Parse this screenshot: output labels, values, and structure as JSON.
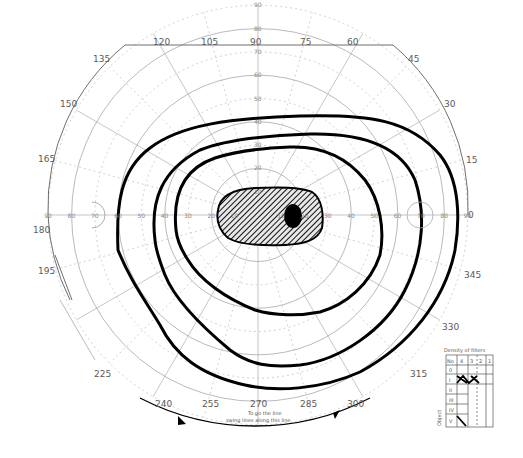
{
  "chart_title": "Goldmann visual field chart",
  "center": {
    "x": 258,
    "y": 215
  },
  "px_per_10deg": 23.3,
  "meridian_labels": [
    {
      "angle": 0,
      "text": "0"
    },
    {
      "angle": 15,
      "text": "15"
    },
    {
      "angle": 30,
      "text": "30"
    },
    {
      "angle": 45,
      "text": "45"
    },
    {
      "angle": 60,
      "text": "60"
    },
    {
      "angle": 75,
      "text": "75"
    },
    {
      "angle": 90,
      "text": "90"
    },
    {
      "angle": 105,
      "text": "105"
    },
    {
      "angle": 120,
      "text": "120"
    },
    {
      "angle": 135,
      "text": "135"
    },
    {
      "angle": 150,
      "text": "150"
    },
    {
      "angle": 165,
      "text": "165"
    },
    {
      "angle": 180,
      "text": "180"
    },
    {
      "angle": 195,
      "text": "195"
    },
    {
      "angle": 225,
      "text": "225"
    },
    {
      "angle": 240,
      "text": "240"
    },
    {
      "angle": 255,
      "text": "255"
    },
    {
      "angle": 270,
      "text": "270"
    },
    {
      "angle": 285,
      "text": "285"
    },
    {
      "angle": 300,
      "text": "300"
    },
    {
      "angle": 315,
      "text": "315"
    },
    {
      "angle": 330,
      "text": "330"
    },
    {
      "angle": 345,
      "text": "345"
    }
  ],
  "eccentricity_labels": [
    "10",
    "20",
    "30",
    "40",
    "50",
    "60",
    "70",
    "80",
    "90"
  ],
  "bottom_note": {
    "line1": "To go the line",
    "line2": "swing lines along this line"
  },
  "filter_table": {
    "title": "Density of filters",
    "header": [
      "No",
      "4",
      "3",
      "2",
      "1"
    ],
    "side_label": "Object",
    "rows": [
      "0",
      "I",
      "II",
      "III",
      "IV",
      "V"
    ]
  },
  "chart_data": {
    "type": "diagram",
    "polar_grid": {
      "rings_deg": [
        10,
        20,
        30,
        40,
        50,
        60,
        70,
        80,
        90
      ],
      "meridians_every_deg": 15
    },
    "isopters": [
      {
        "name": "outer",
        "approx_extent_deg": {
          "temporal": 86,
          "nasal": 60,
          "superior": 42,
          "inferior": 73
        }
      },
      {
        "name": "middle",
        "approx_extent_deg": {
          "temporal": 70,
          "nasal": 44,
          "superior": 34,
          "inferior": 64
        }
      },
      {
        "name": "inner",
        "approx_extent_deg": {
          "temporal": 53,
          "nasal": 36,
          "superior": 29,
          "inferior": 43
        }
      }
    ],
    "scotoma": {
      "type": "central hatched",
      "approx_extent_deg": {
        "left": 18,
        "right": 28,
        "up": 12,
        "down": 12
      },
      "dense_core_at_deg": [
        15,
        0
      ]
    },
    "filter_table_marks": {
      "row_I": [
        "4",
        "3",
        "2"
      ],
      "row_V": [
        "4"
      ]
    }
  }
}
